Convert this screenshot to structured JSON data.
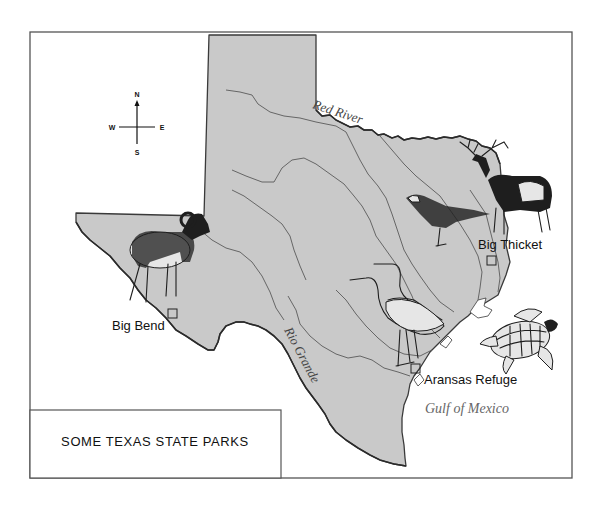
{
  "map": {
    "title": "SOME TEXAS STATE PARKS",
    "compass": {
      "north": "N",
      "south": "S",
      "east": "E",
      "west": "W"
    },
    "water_bodies": [
      {
        "name": "Gulf of Mexico"
      }
    ],
    "rivers": [
      {
        "name": "Red River"
      },
      {
        "name": "Rio Grande"
      }
    ],
    "parks": [
      {
        "name": "Big Bend",
        "animal": "bighorn-sheep"
      },
      {
        "name": "Big Thicket",
        "animal": "elk"
      },
      {
        "name": "Aransas Refuge",
        "animal": "whooping-crane"
      }
    ],
    "illustrations": [
      "bighorn-sheep",
      "elk",
      "hawk",
      "egrets",
      "sea-turtle"
    ],
    "colors": {
      "land": "#c9c9c9",
      "water": "#ffffff",
      "outline": "#3a3a3a",
      "text": "#111111"
    }
  }
}
